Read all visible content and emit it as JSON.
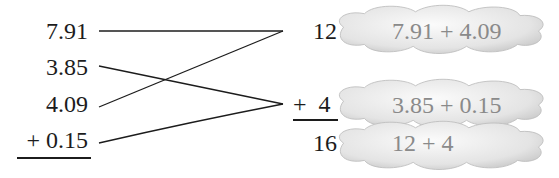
{
  "left_column": {
    "addends": [
      "7.91",
      "3.85",
      "4.09",
      "+ 0.15"
    ]
  },
  "right_column": {
    "partial_sums": [
      "12",
      "+  4"
    ],
    "total": "16"
  },
  "clouds": [
    {
      "expression": "7.91 + 4.09"
    },
    {
      "expression": "3.85 + 0.15"
    },
    {
      "expression": "12 + 4"
    }
  ],
  "pairings": [
    {
      "from": "7.91",
      "to": "12"
    },
    {
      "from": "4.09",
      "to": "12"
    },
    {
      "from": "3.85",
      "to": "+ 4"
    },
    {
      "from": "0.15",
      "to": "+ 4"
    }
  ],
  "colors": {
    "ink": "#1c1c1c",
    "cloud_text": "#8a8a8a",
    "cloud_fill_light": "#f7f7f7",
    "cloud_fill_dark": "#c8c8c8"
  }
}
